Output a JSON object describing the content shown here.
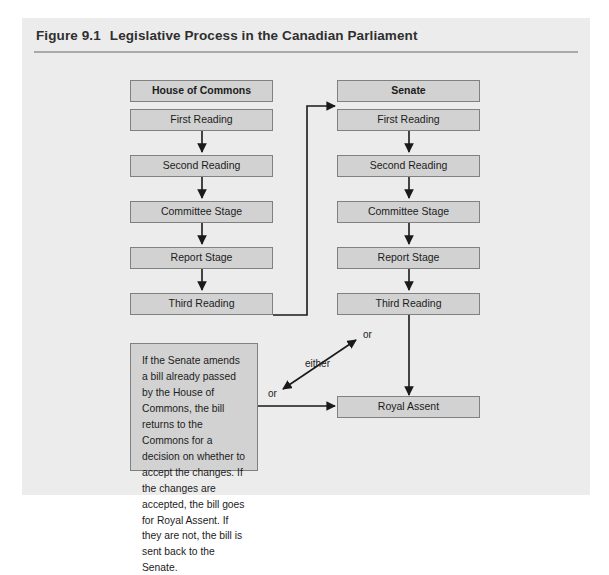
{
  "figure": {
    "number": "Figure 9.1",
    "title": "Legislative Process in the Canadian Parliament"
  },
  "diagram": {
    "columns": [
      {
        "name": "house-of-commons",
        "header": "House of Commons",
        "stages": [
          "First Reading",
          "Second Reading",
          "Committee Stage",
          "Report Stage",
          "Third Reading"
        ]
      },
      {
        "name": "senate",
        "header": "Senate",
        "stages": [
          "First Reading",
          "Second Reading",
          "Committee Stage",
          "Report Stage",
          "Third Reading"
        ]
      }
    ],
    "house": {
      "header": "House of Commons",
      "first_reading": "First Reading",
      "second_reading": "Second Reading",
      "committee_stage": "Committee Stage",
      "report_stage": "Report Stage",
      "third_reading": "Third Reading"
    },
    "senate": {
      "header": "Senate",
      "first_reading": "First Reading",
      "second_reading": "Second Reading",
      "committee_stage": "Committee Stage",
      "report_stage": "Report Stage",
      "third_reading": "Third Reading"
    },
    "royal_assent": "Royal Assent",
    "note": "If the Senate amends a bill already passed by the House of Commons, the bill returns to the Commons for a decision on whether to accept the changes. If the changes are accepted, the bill goes for Royal Assent. If they are not, the bill is sent back to the Senate.",
    "edge_labels": {
      "either": "either",
      "or_upper": "or",
      "or_lower": "or"
    }
  },
  "colors": {
    "panel_background": "#ececec",
    "node_fill": "#d2d2d2",
    "node_border": "#808080",
    "connector": "#1a1a1a",
    "title_text": "#2f2f2f",
    "rule": "#a9a9a9"
  }
}
